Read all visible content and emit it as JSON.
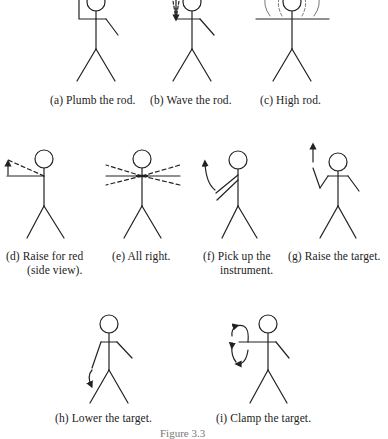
{
  "figures": [
    {
      "id": "a",
      "caption": "(a) Plumb the rod."
    },
    {
      "id": "b",
      "caption": "(b) Wave the rod."
    },
    {
      "id": "c",
      "caption": "(c) High rod."
    },
    {
      "id": "d",
      "caption_line1": "(d) Raise for red",
      "caption_line2": "(side view)."
    },
    {
      "id": "e",
      "caption": "(e) All right."
    },
    {
      "id": "f",
      "caption_line1": "(f) Pick up the",
      "caption_line2": "instrument."
    },
    {
      "id": "g",
      "caption": "(g) Raise the target."
    },
    {
      "id": "h",
      "caption": "(h) Lower the target."
    },
    {
      "id": "i",
      "caption": "(i) Clamp the target."
    }
  ],
  "figure_caption": "Figure 3.3",
  "colors": {
    "line": "#222222",
    "background": "#ffffff"
  }
}
